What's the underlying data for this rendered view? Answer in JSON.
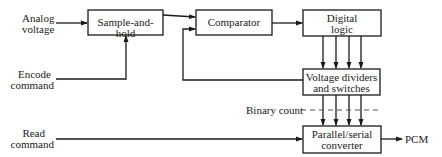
{
  "diagram": {
    "title": "",
    "inputs": {
      "analog_voltage": [
        "Analog",
        "voltage"
      ],
      "encode_command": [
        "Encode",
        "command"
      ],
      "read_command": [
        "Read",
        "command"
      ]
    },
    "blocks": {
      "sample_and_hold": [
        "Sample-and-hold"
      ],
      "comparator": [
        "Comparator"
      ],
      "digital_logic": [
        "Digital",
        "logic"
      ],
      "voltage_dividers": [
        "Voltage dividers",
        "and switches"
      ],
      "parallel_serial": [
        "Parallel/serial",
        "converter"
      ]
    },
    "labels": {
      "binary_count": "Binary count",
      "output": "PCM"
    },
    "edges": [
      {
        "from": "analog_voltage",
        "to": "sample_and_hold"
      },
      {
        "from": "encode_command",
        "to": "sample_and_hold"
      },
      {
        "from": "sample_and_hold",
        "to": "comparator"
      },
      {
        "from": "voltage_dividers",
        "to": "comparator",
        "type": "feedback"
      },
      {
        "from": "comparator",
        "to": "digital_logic"
      },
      {
        "from": "digital_logic",
        "to": "voltage_dividers",
        "count": 4
      },
      {
        "from": "voltage_dividers",
        "to": "parallel_serial",
        "count": 4,
        "label": "Binary count"
      },
      {
        "from": "read_command",
        "to": "parallel_serial"
      },
      {
        "from": "parallel_serial",
        "to": "PCM"
      }
    ],
    "colors": {
      "line": "#1a1a1a",
      "dashed": "#555555",
      "background": "#ffffff"
    }
  }
}
